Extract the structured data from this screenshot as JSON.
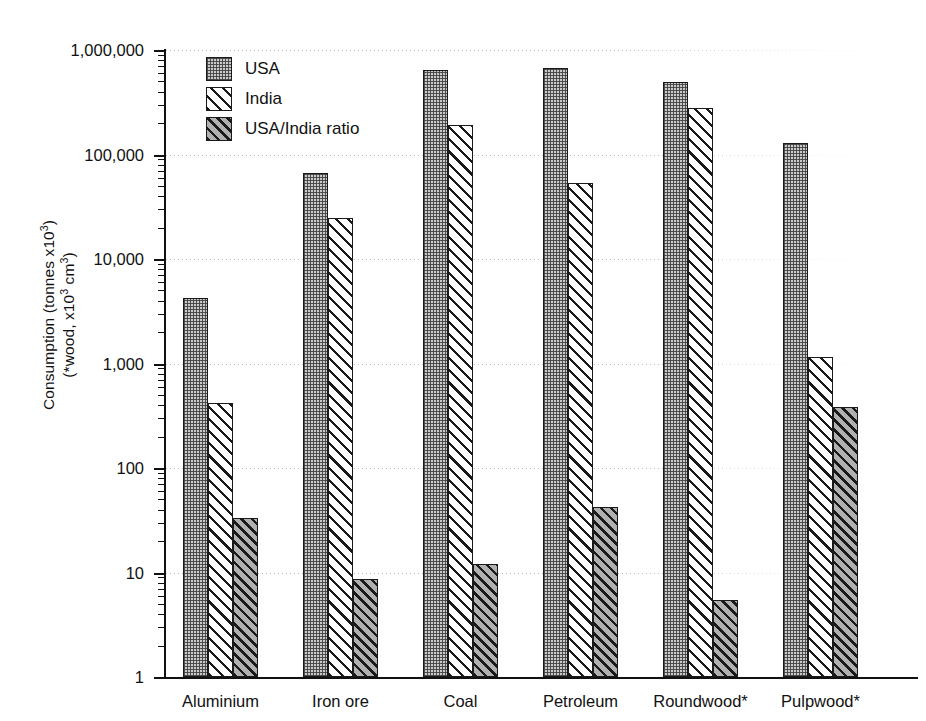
{
  "chart_data": {
    "type": "bar",
    "title": "",
    "xlabel": "",
    "ylabel_line1": "Consumption (tonnes x10",
    "ylabel_line1_sup": "3",
    "ylabel_line1_end": ")",
    "ylabel_line2": "(*wood, x10",
    "ylabel_line2_sup": "3",
    "ylabel_line2_mid": " cm",
    "ylabel_line2_sup2": "3",
    "ylabel_line2_end": ")",
    "yscale": "log",
    "ylim": [
      1,
      1000000
    ],
    "grid": true,
    "legend_position": "top-left",
    "categories": [
      "Aluminium",
      "Iron ore",
      "Coal",
      "Petroleum",
      "Roundwood*",
      "Pulpwood*"
    ],
    "ytick_labels": [
      "1,000,000",
      "100,000",
      "10,000",
      "1,000",
      "100",
      "10",
      "1"
    ],
    "ytick_values": [
      1000000,
      100000,
      10000,
      1000,
      100,
      10,
      1
    ],
    "series": [
      {
        "name": "USA",
        "pattern": "checkered-stipple",
        "values": [
          4200,
          67000,
          650000,
          680000,
          490000,
          130000
        ]
      },
      {
        "name": "India",
        "pattern": "diagonal-hatch-light",
        "values": [
          420,
          24500,
          190000,
          53000,
          280000,
          1150
        ]
      },
      {
        "name": "USA/India ratio",
        "pattern": "diagonal-hatch-dark",
        "values": [
          33,
          8.7,
          12,
          42,
          5.5,
          380
        ]
      }
    ]
  },
  "legend": {
    "items": [
      {
        "label": "USA",
        "pattern": "pat-usa"
      },
      {
        "label": "India",
        "pattern": "pat-india"
      },
      {
        "label": "USA/India ratio",
        "pattern": "pat-ratio"
      }
    ]
  }
}
